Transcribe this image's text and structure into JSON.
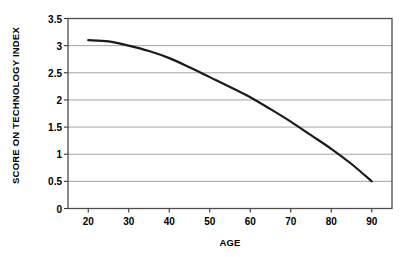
{
  "chart_data": {
    "type": "line",
    "title": "",
    "xlabel": "AGE",
    "ylabel": "SCORE ON TECHNOLOGY INDEX",
    "xlim": [
      15,
      95
    ],
    "ylim": [
      0,
      3.5
    ],
    "grid": true,
    "legend": false,
    "xticks": [
      20,
      30,
      40,
      50,
      60,
      70,
      80,
      90
    ],
    "xtick_labels": [
      "20",
      "30",
      "40",
      "50",
      "60",
      "70",
      "80",
      "90"
    ],
    "yticks": [
      0,
      0.5,
      1,
      1.5,
      2,
      2.5,
      3,
      3.5
    ],
    "ytick_labels": [
      "0",
      "0.5",
      "1",
      "1.5",
      "2",
      "2.5",
      "3",
      "3.5"
    ],
    "series": [
      {
        "name": "Score on technology index",
        "x": [
          20,
          25,
          30,
          35,
          40,
          45,
          50,
          55,
          60,
          65,
          70,
          75,
          80,
          85,
          90
        ],
        "values": [
          3.1,
          3.08,
          3.0,
          2.9,
          2.77,
          2.6,
          2.42,
          2.24,
          2.05,
          1.83,
          1.6,
          1.35,
          1.1,
          0.82,
          0.5
        ]
      }
    ],
    "line_color": "#1a1a1a",
    "line_width": 2.2,
    "grid_color": "#9a9a9a",
    "border_color": "#4d4d4d",
    "background_color": "#ffffff"
  }
}
